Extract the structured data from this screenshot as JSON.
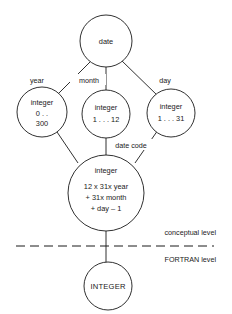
{
  "diagram": {
    "nodes": {
      "root": {
        "id": "date",
        "label": "date"
      },
      "year": {
        "id": "year-node",
        "line1": "integer",
        "line2": "0 . .",
        "line3": "300"
      },
      "month": {
        "id": "month-node",
        "line1": "integer",
        "line2": "1 . . . 12"
      },
      "day": {
        "id": "day-node",
        "line1": "integer",
        "line2": "1 . . . 31"
      },
      "datecode": {
        "id": "date-code-node",
        "line1": "integer",
        "line2": "12 x 31x year",
        "line3": "+ 31x month",
        "line4": "+ day – 1"
      },
      "fortran": {
        "id": "fortran-node",
        "label": "INTEGER"
      }
    },
    "edge_labels": {
      "year": "year",
      "month": "month",
      "day": "day",
      "date_code": "date code"
    },
    "levels": {
      "conceptual": "conceptual level",
      "fortran": "FORTRAN level"
    },
    "colors": {
      "stroke": "#1a1a1a",
      "background": "#ffffff"
    }
  }
}
